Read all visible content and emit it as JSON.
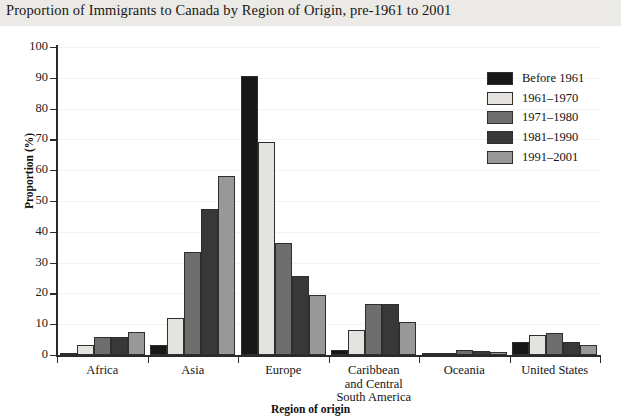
{
  "chart_data": {
    "type": "bar",
    "title": "Proportion of Immigrants to Canada by Region of Origin, pre-1961 to 2001",
    "xlabel": "Region of origin",
    "ylabel": "Proportion (%)",
    "ylim": [
      0,
      100
    ],
    "ytick_step": 10,
    "yticks": [
      0,
      10,
      20,
      30,
      40,
      50,
      60,
      70,
      80,
      90,
      100
    ],
    "grid": true,
    "legend_position": "top-right",
    "categories": [
      "Africa",
      "Asia",
      "Europe",
      "Caribbean and Central South  America",
      "Oceania",
      "United States"
    ],
    "category_lines": [
      [
        "Africa"
      ],
      [
        "Asia"
      ],
      [
        "Europe"
      ],
      [
        "Caribbean",
        "and Central",
        "South  America"
      ],
      [
        "Oceania"
      ],
      [
        "United States"
      ]
    ],
    "series": [
      {
        "name": "Before 1961",
        "color": "#171717",
        "values": [
          0.6,
          3.2,
          90.5,
          1.5,
          0.6,
          4.2
        ]
      },
      {
        "name": "1961–1970",
        "color": "#e4e3e0",
        "values": [
          3.4,
          12.1,
          69.0,
          8.0,
          0.8,
          6.5
        ]
      },
      {
        "name": "1971–1980",
        "color": "#6e6e6e",
        "values": [
          6.0,
          33.5,
          36.4,
          16.6,
          1.5,
          7.0
        ]
      },
      {
        "name": "1981–1990",
        "color": "#383838",
        "values": [
          6.0,
          47.5,
          25.6,
          16.5,
          1.2,
          4.1
        ]
      },
      {
        "name": "1991–2001",
        "color": "#989898",
        "values": [
          7.5,
          58.2,
          19.6,
          10.6,
          0.9,
          3.1
        ]
      }
    ]
  },
  "legend": {
    "items": [
      {
        "label": "Before 1961",
        "color": "#171717"
      },
      {
        "label": "1961–1970",
        "color": "#e4e3e0"
      },
      {
        "label": "1971–1980",
        "color": "#6e6e6e"
      },
      {
        "label": "1981–1990",
        "color": "#383838"
      },
      {
        "label": "1991–2001",
        "color": "#989898"
      }
    ]
  }
}
